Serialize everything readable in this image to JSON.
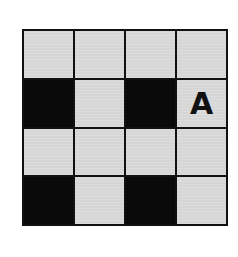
{
  "grid": {
    "rows": 4,
    "cols": 4,
    "colors": {
      "light": "#d6d6d6",
      "dark": "#0a0a0a",
      "border": "#111111"
    },
    "cells": [
      [
        {
          "state": "light",
          "label": ""
        },
        {
          "state": "light",
          "label": ""
        },
        {
          "state": "light",
          "label": ""
        },
        {
          "state": "light",
          "label": ""
        }
      ],
      [
        {
          "state": "dark",
          "label": ""
        },
        {
          "state": "light",
          "label": ""
        },
        {
          "state": "dark",
          "label": ""
        },
        {
          "state": "light",
          "label": "A"
        }
      ],
      [
        {
          "state": "light",
          "label": ""
        },
        {
          "state": "light",
          "label": ""
        },
        {
          "state": "light",
          "label": ""
        },
        {
          "state": "light",
          "label": ""
        }
      ],
      [
        {
          "state": "dark",
          "label": ""
        },
        {
          "state": "light",
          "label": ""
        },
        {
          "state": "dark",
          "label": ""
        },
        {
          "state": "light",
          "label": ""
        }
      ]
    ]
  }
}
